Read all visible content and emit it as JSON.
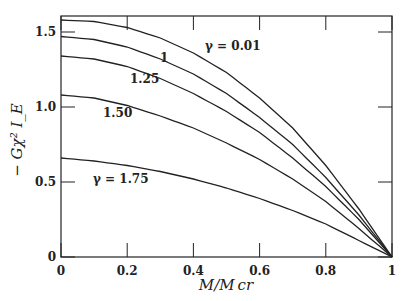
{
  "chart_data": {
    "type": "line",
    "title": "",
    "xlabel": "M/M_cr",
    "ylabel": "-Gχ²I_E",
    "xlim": [
      0,
      1
    ],
    "ylim": [
      0,
      1.6
    ],
    "xticks": [
      "0",
      "0.2",
      "0.4",
      "0.6",
      "0.8",
      "1"
    ],
    "yticks": [
      "0",
      "0.5",
      "1.0",
      "1.5"
    ],
    "x": [
      0,
      0.1,
      0.2,
      0.3,
      0.4,
      0.5,
      0.6,
      0.7,
      0.8,
      0.9,
      1.0
    ],
    "series": [
      {
        "name": "γ = 0.01",
        "label": "γ = 0.01",
        "values": [
          1.58,
          1.57,
          1.53,
          1.46,
          1.36,
          1.23,
          1.06,
          0.86,
          0.61,
          0.32,
          0
        ]
      },
      {
        "name": "1",
        "label": "1",
        "values": [
          1.47,
          1.45,
          1.4,
          1.32,
          1.22,
          1.09,
          0.93,
          0.75,
          0.53,
          0.28,
          0
        ]
      },
      {
        "name": "1.25",
        "label": "1.25",
        "values": [
          1.34,
          1.32,
          1.27,
          1.19,
          1.09,
          0.97,
          0.83,
          0.66,
          0.47,
          0.25,
          0
        ]
      },
      {
        "name": "1.50",
        "label": "1.50",
        "values": [
          1.08,
          1.06,
          1.01,
          0.94,
          0.86,
          0.76,
          0.65,
          0.52,
          0.37,
          0.19,
          0
        ]
      },
      {
        "name": "γ = 1.75",
        "label": "γ = 1.75",
        "values": [
          0.66,
          0.64,
          0.61,
          0.57,
          0.52,
          0.46,
          0.39,
          0.31,
          0.22,
          0.11,
          0
        ]
      }
    ]
  }
}
